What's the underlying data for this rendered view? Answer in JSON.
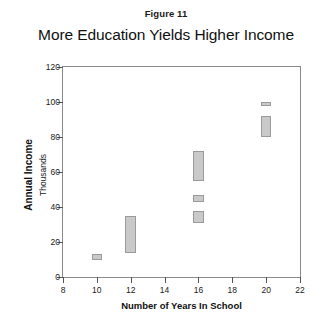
{
  "figure": {
    "caption": "Figure 11"
  },
  "chart_data": {
    "type": "bar",
    "title": "More Education Yields Higher Income",
    "subtitle": "",
    "xlabel": "Number of Years In School",
    "ylabel": "Annual Income",
    "ylabel_sub": "Thousands",
    "xlim": [
      8,
      22
    ],
    "ylim": [
      0,
      120
    ],
    "xticks": [
      8,
      10,
      12,
      14,
      16,
      18,
      20,
      22
    ],
    "yticks": [
      0,
      20,
      40,
      60,
      80,
      100,
      120
    ],
    "grid": false,
    "legend": null,
    "bar_style": {
      "fill": "#c9c9c9",
      "border": "#9a9a9a",
      "width_units": 0.62
    },
    "note": "Each mark is a vertical range box spanning an income interval at a given number of years in school.",
    "ranges": [
      {
        "x": 10,
        "low": 10,
        "high": 13
      },
      {
        "x": 12,
        "low": 14,
        "high": 35
      },
      {
        "x": 16,
        "low": 31,
        "high": 38
      },
      {
        "x": 16,
        "low": 43,
        "high": 47
      },
      {
        "x": 16,
        "low": 55,
        "high": 72
      },
      {
        "x": 20,
        "low": 80,
        "high": 92
      },
      {
        "x": 20,
        "low": 98,
        "high": 100
      }
    ],
    "categories": [
      10,
      12,
      16,
      16,
      16,
      20,
      20
    ],
    "values": [
      13,
      35,
      38,
      47,
      72,
      92,
      100
    ]
  }
}
